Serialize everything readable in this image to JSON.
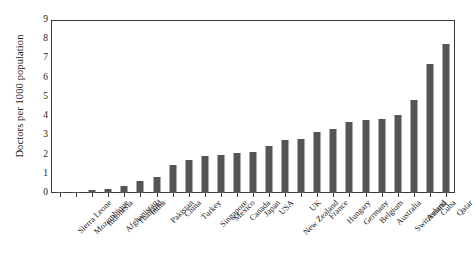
{
  "chart_data": {
    "type": "bar",
    "title": "",
    "subtitle": "",
    "xlabel": "",
    "ylabel": "Doctors per 1000 population",
    "ylim": [
      0,
      9
    ],
    "ytick_labels": [
      "0",
      "1",
      "2",
      "3",
      "4",
      "5",
      "6",
      "7",
      "8",
      "9"
    ],
    "ytick_values": [
      0,
      1,
      2,
      3,
      4,
      5,
      6,
      7,
      8,
      9
    ],
    "grid": false,
    "legend": false,
    "legend_position": "none",
    "bar_color": "#555555",
    "axis_color": "#3a3a3a",
    "background_color": "#ffffff",
    "categories": [
      "Sierra Leone",
      "Mozambique",
      "Indonesia",
      "Afghanistan",
      "Thailand",
      "India",
      "Pakistan",
      "China",
      "Turkey",
      "Singapore",
      "Mexico",
      "Canada",
      "Japan",
      "USA",
      "New Zealand",
      "UK",
      "France",
      "Hungary",
      "Germany",
      "Belgium",
      "Australia",
      "Switzerland",
      "Austria",
      "Cuba",
      "Qatar"
    ],
    "values": [
      0.02,
      0.03,
      0.14,
      0.21,
      0.39,
      0.65,
      0.81,
      1.45,
      1.7,
      1.92,
      2.0,
      2.07,
      2.14,
      2.45,
      2.74,
      2.81,
      3.18,
      3.33,
      3.69,
      3.78,
      3.85,
      4.05,
      4.86,
      6.72,
      7.74
    ]
  }
}
